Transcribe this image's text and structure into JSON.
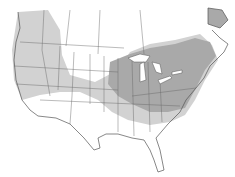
{
  "map": {
    "type": "range-map",
    "region": "North America (United States and southern Canada)",
    "legend": [],
    "colors": {
      "background": "#ffffff",
      "land": "#ffffff",
      "range_outer": "#d2d2d2",
      "range_core": "#a9a9a9",
      "borders": "#555555",
      "lakes": "#ffffff"
    },
    "zones": [
      {
        "name": "outer-range",
        "description": "Western US, Pacific Northwest, southern Canada band, southern plains and southeast"
      },
      {
        "name": "core-range",
        "description": "Great Lakes, Midwest, Ohio Valley, Northeast US and Maritime Canada"
      }
    ],
    "labels": []
  }
}
